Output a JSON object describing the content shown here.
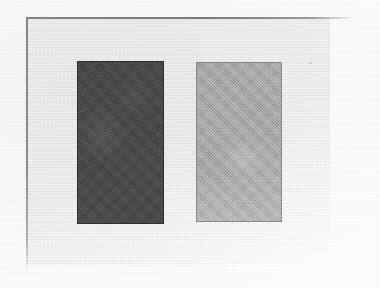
{
  "document": {
    "kind": "scanned-figure",
    "page_background": "#fdfdfd",
    "panel_background": "#ededed",
    "rule_color": "#8a8a8a"
  },
  "chart_data": {
    "type": "bar",
    "title": "",
    "subtitle": "",
    "xlabel": "",
    "ylabel": "",
    "grid": false,
    "legend": null,
    "categories": [
      "",
      ""
    ],
    "tick_labels": [],
    "annotations": [],
    "values": [
      163,
      160
    ],
    "value_unit": "px",
    "series": [
      {
        "name": "",
        "values": [
          163,
          160
        ],
        "colors": [
          "#4a4a4a",
          "#a8a8a8"
        ]
      }
    ],
    "bars": [
      {
        "id": "bar-dark",
        "label": "",
        "fill": "#4a4a4a",
        "stroke": "#2f2f2f",
        "x": 77,
        "y": 61,
        "width": 87,
        "height": 163
      },
      {
        "id": "bar-light",
        "label": "",
        "fill": "#a8a8a8",
        "stroke": "#8d8d8d",
        "x": 196,
        "y": 62,
        "width": 86,
        "height": 160
      }
    ],
    "panel": {
      "x": 27,
      "y": 18,
      "width": 303,
      "height": 247
    },
    "frame": {
      "top_rule": {
        "x": 26,
        "y": 17,
        "length": 329
      },
      "left_rule": {
        "x": 26,
        "y": 17,
        "length": 255
      }
    }
  }
}
